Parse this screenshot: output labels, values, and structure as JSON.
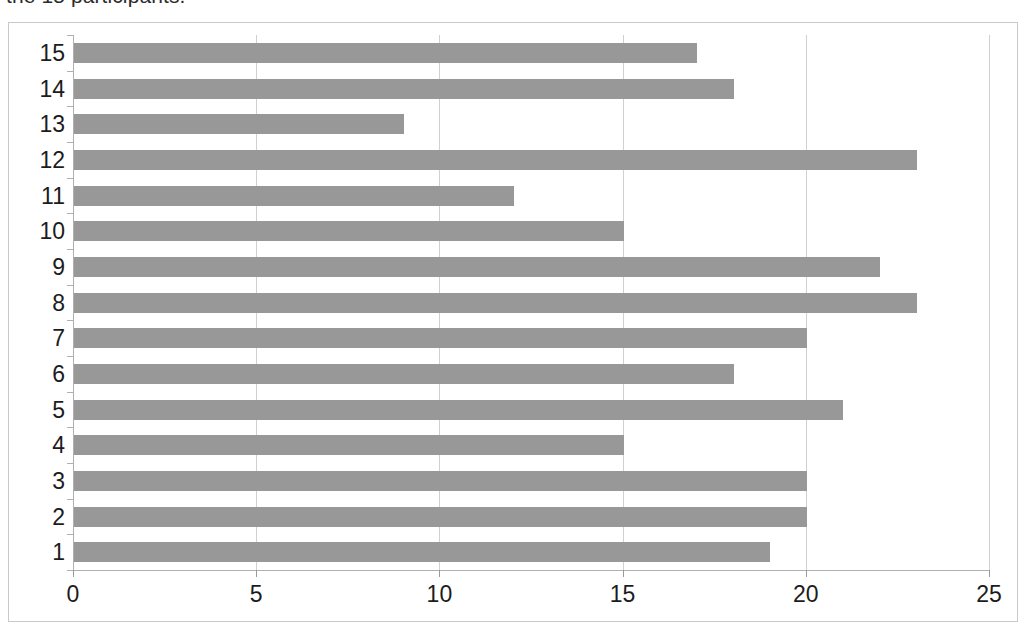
{
  "caption": {
    "text": "the 15 participants."
  },
  "chart_data": {
    "type": "bar",
    "orientation": "horizontal",
    "title": "",
    "xlabel": "",
    "ylabel": "",
    "categories": [
      "1",
      "2",
      "3",
      "4",
      "5",
      "6",
      "7",
      "8",
      "9",
      "10",
      "11",
      "12",
      "13",
      "14",
      "15"
    ],
    "values": [
      19,
      20,
      20,
      15,
      21,
      18,
      20,
      23,
      22,
      15,
      12,
      23,
      9,
      18,
      17
    ],
    "series": [
      {
        "name": "",
        "values": [
          19,
          20,
          20,
          15,
          21,
          18,
          20,
          23,
          22,
          15,
          12,
          23,
          9,
          18,
          17
        ]
      }
    ],
    "xlim": [
      0,
      25
    ],
    "xticks": [
      0,
      5,
      10,
      15,
      20,
      25
    ],
    "xtick_labels": [
      "0",
      "5",
      "10",
      "15",
      "20",
      "25"
    ],
    "ytick_labels": [
      "15",
      "14",
      "13",
      "12",
      "11",
      "10",
      "9",
      "8",
      "7",
      "6",
      "5",
      "4",
      "3",
      "2",
      "1"
    ],
    "grid": "vertical",
    "legend": "none",
    "bar_color": "#989898",
    "gridline_color": "#d0d0d0",
    "axis_color": "#b0b0b0",
    "frame_color": "#c9c9c9",
    "background": "#ffffff"
  }
}
